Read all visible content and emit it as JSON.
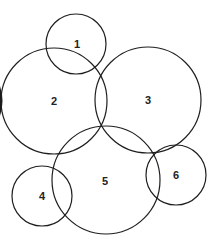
{
  "diagram": {
    "type": "overlapping-circles",
    "stroke_color": "#1f1f1f",
    "background": "#ffffff",
    "circles": [
      {
        "label": "1",
        "cx": 76,
        "cy": 44,
        "r": 30
      },
      {
        "label": "2",
        "cx": 54,
        "cy": 101,
        "r": 53
      },
      {
        "label": "3",
        "cx": 148,
        "cy": 100,
        "r": 53
      },
      {
        "label": "4",
        "cx": 42,
        "cy": 196,
        "r": 30
      },
      {
        "label": "5",
        "cx": 106,
        "cy": 180,
        "r": 54
      },
      {
        "label": "6",
        "cx": 176,
        "cy": 175,
        "r": 30
      }
    ]
  }
}
